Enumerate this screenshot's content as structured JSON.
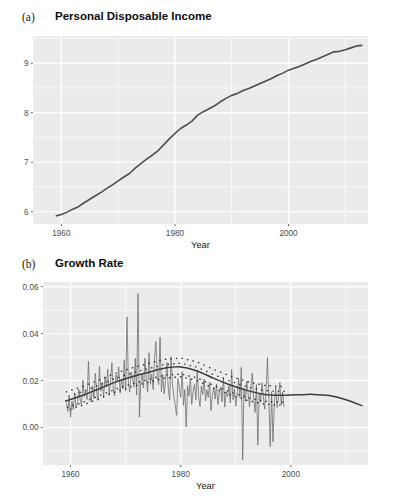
{
  "figure": {
    "background_color": "#ffffff",
    "panel_background": "#ebebeb",
    "gridline_color": "#ffffff",
    "series_color": "#4d4d4d",
    "trend_color": "#3d3d3d"
  },
  "panels": {
    "a": {
      "label": "(a)",
      "title": "Personal Disposable Income"
    },
    "b": {
      "label": "(b)",
      "title": "Growth Rate"
    }
  },
  "chart_data": [
    {
      "type": "line",
      "panel": "a",
      "title": "Personal Disposable Income",
      "xlabel": "Year",
      "ylabel": "",
      "xlim": [
        1955,
        2014
      ],
      "ylim": [
        5.75,
        9.55
      ],
      "xticks": [
        1960,
        1980,
        2000
      ],
      "xticklabels": [
        "1960",
        "1980",
        "2000"
      ],
      "yticks": [
        6,
        7,
        8,
        9
      ],
      "yticklabels": [
        "6",
        "7",
        "8",
        "9"
      ],
      "grid": true,
      "legend": "none",
      "series": [
        {
          "name": "log personal disposable income",
          "x": [
            1959,
            1960,
            1961,
            1962,
            1963,
            1964,
            1965,
            1966,
            1967,
            1968,
            1969,
            1970,
            1971,
            1972,
            1973,
            1974,
            1975,
            1976,
            1977,
            1978,
            1979,
            1980,
            1981,
            1982,
            1983,
            1984,
            1985,
            1986,
            1987,
            1988,
            1989,
            1990,
            1991,
            1992,
            1993,
            1994,
            1995,
            1996,
            1997,
            1998,
            1999,
            2000,
            2001,
            2002,
            2003,
            2004,
            2005,
            2006,
            2007,
            2008,
            2009,
            2010,
            2011,
            2012,
            2013
          ],
          "values": [
            5.91,
            5.94,
            5.99,
            6.05,
            6.1,
            6.18,
            6.25,
            6.32,
            6.39,
            6.47,
            6.54,
            6.62,
            6.7,
            6.77,
            6.88,
            6.97,
            7.06,
            7.14,
            7.23,
            7.35,
            7.47,
            7.58,
            7.68,
            7.75,
            7.83,
            7.95,
            8.02,
            8.08,
            8.14,
            8.22,
            8.29,
            8.35,
            8.39,
            8.45,
            8.49,
            8.54,
            8.59,
            8.64,
            8.69,
            8.75,
            8.8,
            8.86,
            8.9,
            8.94,
            8.99,
            9.04,
            9.08,
            9.13,
            9.18,
            9.23,
            9.24,
            9.27,
            9.31,
            9.35,
            9.36
          ]
        }
      ]
    },
    {
      "type": "line",
      "panel": "b",
      "title": "Growth Rate",
      "xlabel": "Year",
      "ylabel": "",
      "xlim": [
        1955,
        2014
      ],
      "ylim": [
        -0.016,
        0.062
      ],
      "xticks": [
        1960,
        1980,
        2000
      ],
      "xticklabels": [
        "1960",
        "1980",
        "2000"
      ],
      "yticks": [
        0.0,
        0.02,
        0.04,
        0.06
      ],
      "yticklabels": [
        "0.00",
        "0.02",
        "0.04",
        "0.06"
      ],
      "grid": true,
      "legend": "none",
      "series": [
        {
          "name": "quarterly growth rate",
          "style": "noisy-line",
          "x_start": 1959.25,
          "x_step": 0.25,
          "values": [
            0.0105,
            0.0068,
            0.0131,
            0.0043,
            0.0112,
            0.0076,
            0.0148,
            0.0089,
            0.0104,
            0.0163,
            0.0118,
            0.0096,
            0.0202,
            0.0131,
            0.0155,
            0.0119,
            0.0282,
            0.0142,
            0.0109,
            0.0177,
            0.0123,
            0.0231,
            0.0148,
            0.0115,
            0.0261,
            0.0155,
            0.0192,
            0.0128,
            0.0215,
            0.0172,
            0.0249,
            0.0141,
            0.0188,
            0.0276,
            0.0162,
            0.0135,
            0.0224,
            0.0198,
            0.0258,
            0.0147,
            0.0206,
            0.0164,
            0.0288,
            0.0155,
            0.0471,
            0.0193,
            0.0151,
            0.0237,
            0.0213,
            0.0172,
            0.0295,
            0.0138,
            0.0571,
            0.0044,
            0.0188,
            0.0231,
            0.0169,
            0.0295,
            0.0208,
            0.0152,
            0.0318,
            0.0184,
            0.0227,
            0.0162,
            0.0298,
            0.0366,
            0.0211,
            0.0183,
            0.0385,
            0.0152,
            0.0226,
            0.0143,
            0.0199,
            0.0277,
            0.0164,
            0.0118,
            0.0302,
            0.0186,
            0.0133,
            0.0095,
            0.0052,
            0.0208,
            0.0171,
            0.0129,
            0.0238,
            0.0095,
            0.0161,
            0.0002,
            0.0178,
            0.0134,
            0.0212,
            0.0098,
            0.0155,
            0.0183,
            0.0118,
            0.0245,
            0.0132,
            0.0089,
            0.0176,
            0.0141,
            0.0207,
            0.0113,
            0.0161,
            0.0128,
            0.0194,
            0.0072,
            0.0139,
            0.0168,
            0.0121,
            0.0185,
            0.0098,
            0.0146,
            0.0173,
            0.0109,
            0.0215,
            0.0087,
            0.0152,
            0.0131,
            0.0178,
            0.0104,
            0.0247,
            0.0118,
            0.0165,
            0.0091,
            0.0143,
            0.0209,
            0.0127,
            0.0256,
            -0.0138,
            0.0168,
            0.0112,
            0.0198,
            0.0141,
            0.0087,
            0.0172,
            0.0232,
            0.0119,
            0.0064,
            0.0183,
            -0.0075,
            0.0147,
            0.0108,
            0.0191,
            0.0132,
            0.0078,
            0.0164,
            0.0298,
            0.0119,
            -0.0082,
            0.0152,
            -0.0061,
            0.0106,
            0.0173,
            0.0085,
            0.0128,
            0.0191,
            0.0096,
            0.0151,
            0.0087
          ]
        },
        {
          "name": "smooth trend",
          "style": "solid-smooth",
          "x": [
            1959,
            1962,
            1965,
            1968,
            1971,
            1974,
            1977,
            1980,
            1983,
            1986,
            1989,
            1992,
            1995,
            1998,
            2001,
            2004,
            2007,
            2010,
            2013
          ],
          "values": [
            0.0112,
            0.0135,
            0.0163,
            0.0192,
            0.0215,
            0.0234,
            0.0252,
            0.0258,
            0.0241,
            0.0209,
            0.0181,
            0.0158,
            0.0142,
            0.0137,
            0.0139,
            0.0141,
            0.0136,
            0.0118,
            0.0092
          ]
        },
        {
          "name": "seasonal dashed segments",
          "style": "dashed-step",
          "description": "short horizontal dashed level segments straddling the smooth trend"
        }
      ]
    }
  ]
}
